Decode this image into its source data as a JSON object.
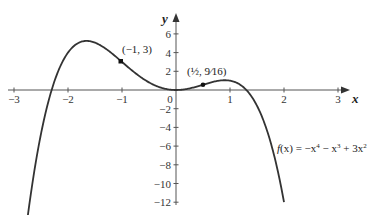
{
  "chart_data": {
    "type": "line",
    "title": "",
    "xlabel": "x",
    "ylabel": "y",
    "xlim": [
      -3,
      3
    ],
    "ylim": [
      -12,
      6
    ],
    "x_ticks": [
      "−3",
      "−2",
      "−1",
      "0",
      "1",
      "2",
      "3"
    ],
    "y_ticks": [
      "6",
      "4",
      "2",
      "−2",
      "−4",
      "−6",
      "−8",
      "−10",
      "−12"
    ],
    "grid": false,
    "series": [
      {
        "name": "f(x) = −x⁴ − x³ + 3x²",
        "function": "-x^4 - x^3 + 3x^2",
        "x_range": [
          -2.75,
          2
        ]
      }
    ],
    "points": [
      {
        "label": "(−1, 3)",
        "x": -1,
        "y": 3
      },
      {
        "label": "(½, 9⁄16)",
        "x": 0.5,
        "y": 0.5625
      }
    ],
    "annotation": {
      "f": "f",
      "x_paren": "(x)",
      "eq": " = −x",
      "p4": "4",
      "m": " − x",
      "p3": "3",
      "plus": " + 3x",
      "p2": "2"
    }
  }
}
